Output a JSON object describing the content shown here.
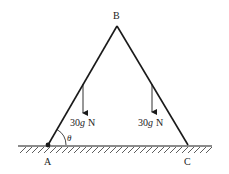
{
  "diagram": {
    "type": "mechanics-ladder",
    "points": {
      "A": {
        "label": "A",
        "x": 48,
        "y": 145
      },
      "B": {
        "label": "B",
        "x": 117,
        "y": 26
      },
      "C": {
        "label": "C",
        "x": 188,
        "y": 145
      }
    },
    "rods": [
      {
        "name": "AB",
        "from": "A",
        "to": "B"
      },
      {
        "name": "BC",
        "from": "B",
        "to": "C"
      }
    ],
    "forces": [
      {
        "name": "weight-left",
        "label_num": "30",
        "label_var": "g",
        "label_unit": "N",
        "x": 83,
        "y1": 84,
        "y2": 113
      },
      {
        "name": "weight-right",
        "label_num": "30",
        "label_var": "g",
        "label_unit": "N",
        "x": 152,
        "y1": 84,
        "y2": 112
      }
    ],
    "angle": {
      "label": "θ",
      "at": "A"
    },
    "ground": {
      "x1": 18,
      "x2": 212,
      "y": 146
    },
    "colors": {
      "line": "#1a1a1a",
      "text": "#222222",
      "background": "#ffffff"
    }
  }
}
